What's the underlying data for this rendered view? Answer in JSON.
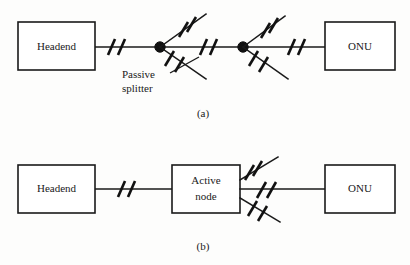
{
  "figure": {
    "background_color": "#fdfdfc",
    "line_color": "#1a1a1a",
    "panels": [
      {
        "id": "panel-a",
        "caption": "(a)",
        "description": "Passive optical network with two passive splitters between headend and ONU",
        "nodes": [
          {
            "id": "headend-a",
            "label": "Headend",
            "type": "box"
          },
          {
            "id": "splitter-1",
            "label": "",
            "type": "passive-splitter"
          },
          {
            "id": "splitter-2",
            "label": "",
            "type": "passive-splitter"
          },
          {
            "id": "onu-a",
            "label": "ONU",
            "type": "box"
          }
        ],
        "annotations": [
          {
            "id": "passive-splitter-label",
            "line1": "Passive",
            "line2": "splitter"
          }
        ]
      },
      {
        "id": "panel-b",
        "caption": "(b)",
        "description": "Active optical network with an active node between headend and ONU",
        "nodes": [
          {
            "id": "headend-b",
            "label": "Headend",
            "type": "box"
          },
          {
            "id": "active-node",
            "label_line1": "Active",
            "label_line2": "node",
            "type": "box"
          },
          {
            "id": "onu-b",
            "label": "ONU",
            "type": "box"
          }
        ],
        "annotations": []
      }
    ]
  }
}
